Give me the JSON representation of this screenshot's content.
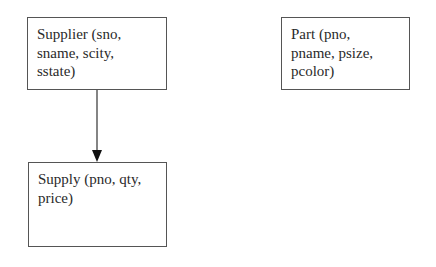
{
  "diagram": {
    "type": "entity-relationship",
    "entities": [
      {
        "id": "supplier",
        "lines": [
          "Supplier (sno,",
          "sname, scity,",
          "sstate)"
        ]
      },
      {
        "id": "part",
        "lines": [
          "Part (pno,",
          "pname, psize,",
          "pcolor)"
        ]
      },
      {
        "id": "supply",
        "lines": [
          "Supply (pno, qty,",
          "price)"
        ]
      }
    ],
    "edges": [
      {
        "from": "supplier",
        "to": "supply",
        "style": "arrow"
      }
    ],
    "colors": {
      "border": "#555555",
      "arrow": "#333333",
      "text": "#2a2a2a",
      "background": "#ffffff"
    }
  }
}
